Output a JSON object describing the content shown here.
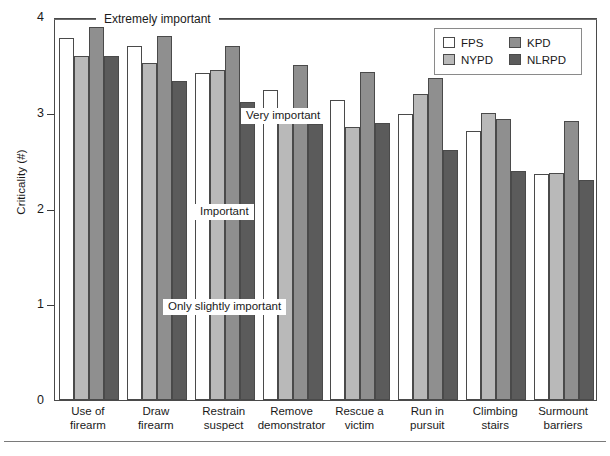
{
  "chart_data": {
    "type": "bar",
    "title": "",
    "xlabel": "",
    "ylabel": "Criticality (#)",
    "ylim": [
      0,
      4
    ],
    "yticks": [
      "0",
      "1",
      "2",
      "3",
      "4"
    ],
    "grid": false,
    "legend_position": "top-right",
    "categories": [
      "Use of firearm",
      "Draw firearm",
      "Restrain suspect",
      "Remove demonstrator",
      "Rescue a victim",
      "Run in pursuit",
      "Climbing stairs",
      "Surmount barriers"
    ],
    "category_lines": [
      [
        "Use of",
        "firearm"
      ],
      [
        "Draw",
        "firearm"
      ],
      [
        "Restrain",
        "suspect"
      ],
      [
        "Remove",
        "demonstrator"
      ],
      [
        "Rescue a",
        "victim"
      ],
      [
        "Run in",
        "pursuit"
      ],
      [
        "Climbing",
        "stairs"
      ],
      [
        "Surmount",
        "barriers"
      ]
    ],
    "series": [
      {
        "name": "FPS",
        "color": "#ffffff",
        "values": [
          3.78,
          3.7,
          3.42,
          3.24,
          3.13,
          2.99,
          2.81,
          2.36
        ]
      },
      {
        "name": "NYPD",
        "color": "#b9b9b9",
        "values": [
          3.59,
          3.52,
          3.45,
          2.97,
          2.85,
          3.2,
          3.0,
          2.37
        ]
      },
      {
        "name": "KPD",
        "color": "#8f8f8f",
        "values": [
          3.9,
          3.8,
          3.7,
          3.5,
          3.43,
          3.36,
          2.94,
          2.91
        ]
      },
      {
        "name": "NLRPD",
        "color": "#5b5b5b",
        "values": [
          3.59,
          3.33,
          3.11,
          2.88,
          2.89,
          2.61,
          2.39,
          2.3
        ]
      }
    ],
    "annotations": [
      {
        "text": "Extremely important",
        "value": 4
      },
      {
        "text": "Very important",
        "value": 3
      },
      {
        "text": "Important",
        "value": 2
      },
      {
        "text": "Only slightly important",
        "value": 1
      }
    ]
  },
  "legend": {
    "entries": [
      {
        "label": "FPS",
        "color": "#ffffff"
      },
      {
        "label": "KPD",
        "color": "#8f8f8f"
      },
      {
        "label": "NYPD",
        "color": "#b9b9b9"
      },
      {
        "label": "NLRPD",
        "color": "#5b5b5b"
      }
    ]
  },
  "caption": ""
}
